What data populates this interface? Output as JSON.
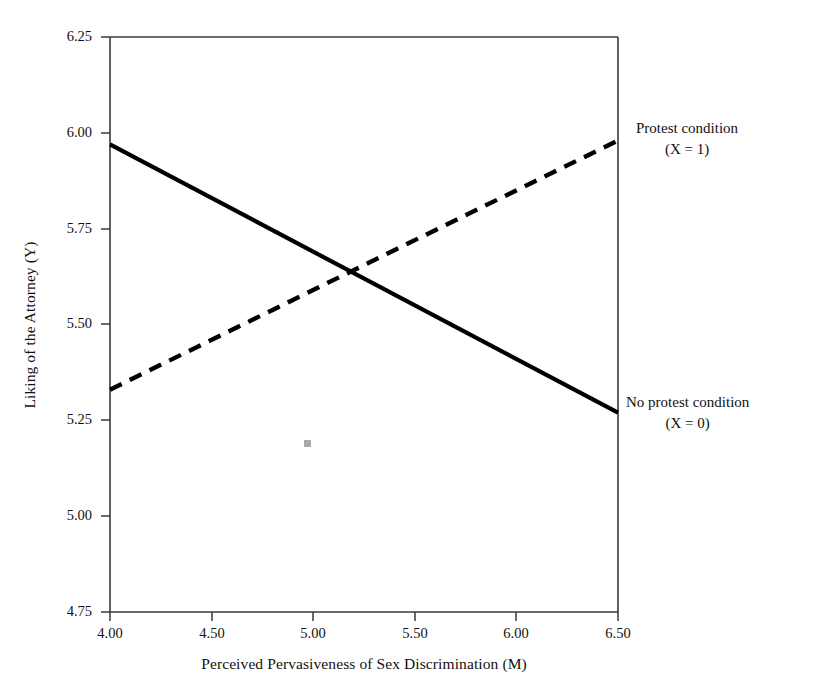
{
  "chart_data": {
    "type": "line",
    "title": "",
    "xlabel": "Perceived Pervasiveness of Sex Discrimination (M)",
    "ylabel": "Liking of the Attorney (Y)",
    "xlim": [
      4.0,
      6.5
    ],
    "ylim": [
      4.75,
      6.25
    ],
    "xticks": [
      "4.00",
      "4.50",
      "5.00",
      "5.50",
      "6.00",
      "6.50"
    ],
    "yticks": [
      "4.75",
      "5.00",
      "5.25",
      "5.50",
      "5.75",
      "6.00",
      "6.25"
    ],
    "grid": false,
    "legend_position": "right-inline-annotations",
    "series": [
      {
        "name": "No protest condition (X = 0)",
        "style": "solid",
        "color": "#000000",
        "x": [
          4.0,
          6.5
        ],
        "values": [
          5.97,
          5.27
        ]
      },
      {
        "name": "Protest condition (X = 1)",
        "style": "dashed",
        "color": "#000000",
        "x": [
          4.0,
          6.5
        ],
        "values": [
          5.33,
          5.98
        ]
      }
    ],
    "annotations": [
      {
        "line1": "Protest condition",
        "line2": "(X = 1)"
      },
      {
        "line1": "No protest condition",
        "line2": "(X = 0)"
      }
    ],
    "intersection": {
      "x": 5.2,
      "y": 5.64
    }
  },
  "axes": {
    "y_title": "Liking of the Attorney (Y)",
    "x_title": "Perceived Pervasiveness of Sex Discrimination (M)",
    "y_tick_labels": [
      "6.25",
      "6.00",
      "5.75",
      "5.50",
      "5.25",
      "5.00",
      "4.75"
    ],
    "x_tick_labels": [
      "4.00",
      "4.50",
      "5.00",
      "5.50",
      "6.00",
      "6.50"
    ]
  },
  "annotations": {
    "protest": {
      "line1": "Protest condition",
      "line2": "(X = 1)"
    },
    "no_protest": {
      "line1": "No protest condition",
      "line2": "(X = 0)"
    }
  },
  "colors": {
    "line": "#000000",
    "frame": "#3a3a3a",
    "text": "#111111",
    "background": "#ffffff",
    "speck": "#9a9a9a"
  }
}
